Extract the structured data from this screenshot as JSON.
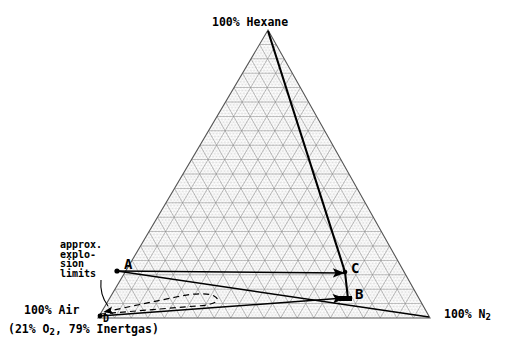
{
  "chart_data": {
    "type": "ternary",
    "title": "",
    "axes": [
      {
        "name": "top-vertex",
        "label": "100% Hexane",
        "component": "Hexane"
      },
      {
        "name": "bottom-right-vertex",
        "label": "100% N2",
        "component": "N2"
      },
      {
        "name": "bottom-left-vertex",
        "label": "100% Air",
        "component": "Air"
      }
    ],
    "vertex_labels": {
      "top": "100% Hexane",
      "right": "100% N",
      "right_sub": "2",
      "left": "100% Air",
      "left_note_pre": "(21% O",
      "left_note_sub": "2",
      "left_note_post": ", 79% Inertgas)"
    },
    "annotation": {
      "name": "approx-explosion-limits",
      "lines": [
        "approx.",
        "explo-",
        "sion",
        "limits"
      ],
      "text": "approx. explosion limits"
    },
    "points": [
      {
        "id": "A",
        "label": "A",
        "x_px": 116,
        "y_px": 270,
        "hexane_pct": 8,
        "n2_pct": 2,
        "air_pct": 90
      },
      {
        "id": "B",
        "label": "B",
        "x_px": 348,
        "y_px": 299,
        "hexane_pct": 2,
        "n2_pct": 74,
        "air_pct": 24
      },
      {
        "id": "C",
        "label": "C",
        "x_px": 345,
        "y_px": 272,
        "hexane_pct": 11,
        "n2_pct": 68,
        "air_pct": 21
      },
      {
        "id": "D",
        "label": "D",
        "x_px": 100,
        "y_px": 316,
        "hexane_pct": 0,
        "n2_pct": 1,
        "air_pct": 99
      }
    ],
    "lines": [
      {
        "name": "hexane-to-B-dilution-line",
        "from": "100% Hexane apex",
        "to": "B",
        "style": "solid-heavy",
        "via": "C"
      },
      {
        "name": "A-to-C-arrow",
        "from": "A",
        "to": "C",
        "style": "solid",
        "arrow": "at-C"
      },
      {
        "name": "D-to-B-arrow",
        "from": "D",
        "to": "B",
        "style": "solid",
        "arrow": "at-B"
      },
      {
        "name": "A-to-N2-vertex-line",
        "from": "A",
        "to": "100% N2 vertex",
        "style": "solid"
      },
      {
        "name": "explosion-limit-envelope",
        "from": "D",
        "to": "D",
        "style": "dashed-loop"
      }
    ],
    "grid": {
      "major_divisions": 20,
      "minor_divisions": 100,
      "major_color": "#8a8a8a",
      "minor_color": "#cfcfcf",
      "outline_color": "#555555"
    },
    "colors": {
      "background": "#ffffff",
      "ink": "#000000",
      "grid_major": "#8a8a8a",
      "grid_minor": "#cfcfcf"
    },
    "geometry": {
      "apex": {
        "x": 268,
        "y": 30
      },
      "left_vertex": {
        "x": 98,
        "y": 318
      },
      "right_vertex": {
        "x": 430,
        "y": 318
      }
    }
  }
}
